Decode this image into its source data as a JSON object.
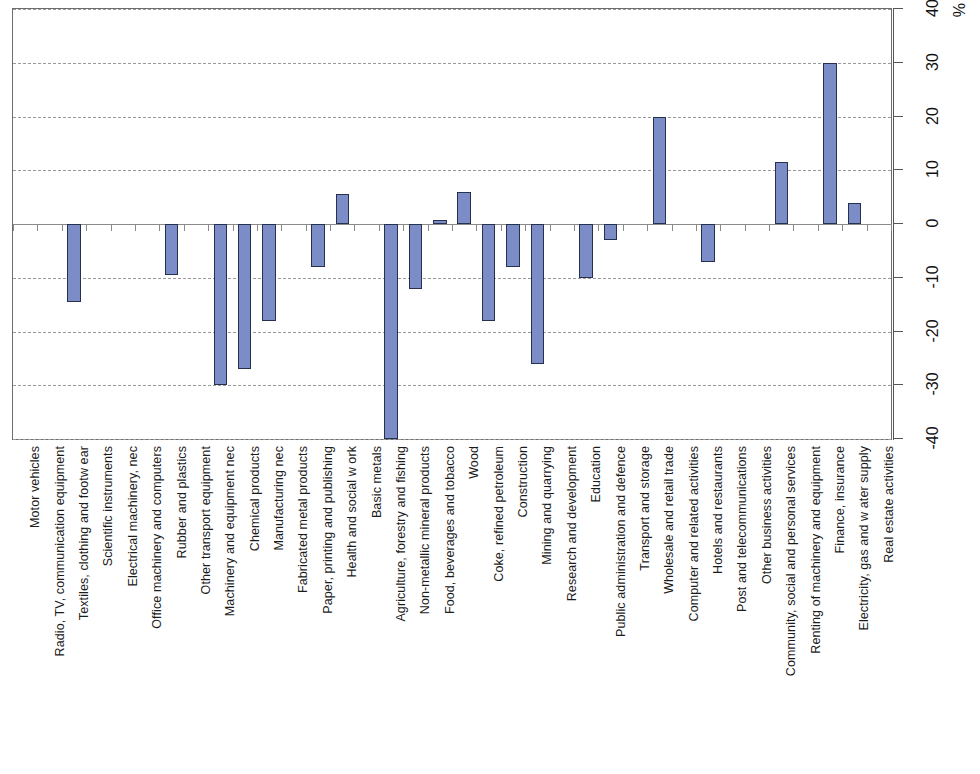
{
  "chart_data": {
    "type": "bar",
    "title": "",
    "subtitle": "",
    "xlabel": "",
    "ylabel": "%",
    "unit": "%",
    "ylim": [
      -40,
      40
    ],
    "ytick_step": 10,
    "yticks": [
      40,
      30,
      20,
      10,
      0,
      -10,
      -20,
      -30,
      -40
    ],
    "ytick_labels": [
      "40",
      "30",
      "20",
      "10",
      "0",
      "-10",
      "-20",
      "-30",
      "-40"
    ],
    "grid": true,
    "grid_axis": "y",
    "legend": false,
    "legend_position": "none",
    "orientation": "vertical",
    "category_label_rotation": -90,
    "value_axis_position": "right",
    "bar_color": "#7b8cc6",
    "bar_border_color": "#26304f",
    "grid_color": "#9a9a9a",
    "axis_color": "#6d6d6d",
    "categories": [
      "Motor vehicles",
      "Radio, TV, communication equipment",
      "Textiles, clothing and footw ear",
      "Scientific instruments",
      "Electrical machinery, nec",
      "Office machinery and computers",
      "Rubber and plastics",
      "Other transport equipment",
      "Machinery and equipment nec",
      "Chemical products",
      "Manufacturing nec",
      "Fabricated metal products",
      "Paper, printing and publishing",
      "Health and social w ork",
      "Basic metals",
      "Agriculture, forestry and fishing",
      "Non-metallic mineral products",
      "Food, beverages and tobacco",
      "Wood",
      "Coke, refined petroleum",
      "Construction",
      "Mining and quarrying",
      "Research and development",
      "Education",
      "Public administration and defence",
      "Transport and storage",
      "Wholesale and retail trade",
      "Computer and related activities",
      "Hotels and restaurants",
      "Post and telecommunications",
      "Other business activities",
      "Community, social and personal services",
      "Renting of machinery and equipment",
      "Finance, insurance",
      "Electricity, gas and w ater supply",
      "Real estate activities"
    ],
    "values": [
      0,
      0,
      -14.5,
      0,
      0,
      0,
      -9.5,
      0,
      -30,
      -27,
      -18,
      0,
      -8,
      5.5,
      0,
      -40,
      -12,
      0.7,
      6,
      -18,
      -8,
      -26,
      0,
      -10,
      -3,
      0,
      20,
      0,
      -7,
      0,
      0,
      11.5,
      0,
      30,
      4,
      0
    ]
  }
}
